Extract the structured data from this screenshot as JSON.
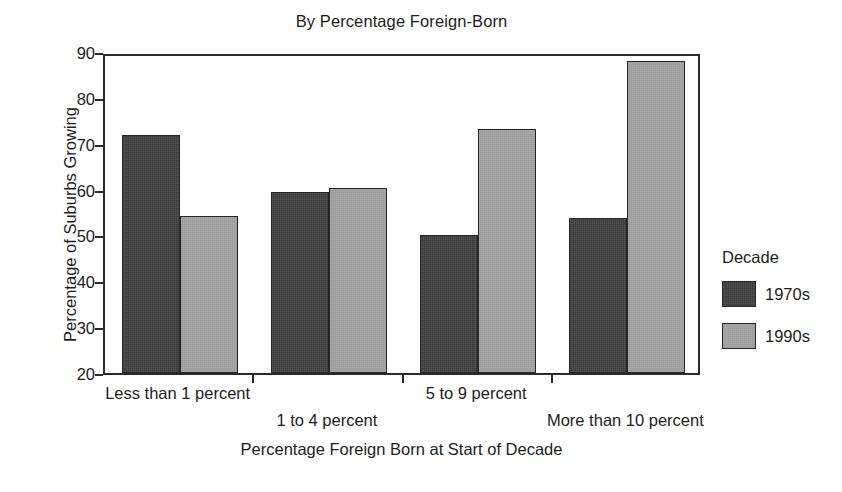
{
  "chart_data": {
    "type": "bar",
    "title": "By Percentage Foreign-Born",
    "xlabel": "Percentage Foreign Born at Start of Decade",
    "ylabel": "Percentage of Suburbs Growing",
    "categories": [
      "Less than 1 percent",
      "1 to 4 percent",
      "5 to 9 percent",
      "More than 10 percent"
    ],
    "series": [
      {
        "name": "1970s",
        "color": "#3b3b3b",
        "values": [
          72.0,
          59.4,
          50.2,
          53.7
        ]
      },
      {
        "name": "1990s",
        "color": "#9d9d9d",
        "values": [
          54.3,
          60.3,
          73.3,
          88.0
        ]
      }
    ],
    "ylim": [
      20,
      90
    ],
    "yticks": [
      20,
      30,
      40,
      50,
      60,
      70,
      80,
      90
    ],
    "ytick_labels": [
      "20",
      "30",
      "40",
      "50",
      "60",
      "70",
      "80",
      "90"
    ],
    "grid": false,
    "legend": {
      "position": "right",
      "title": "Decade",
      "entries": [
        "1970s",
        "1990s"
      ]
    },
    "category_label_rows": [
      0,
      1,
      0,
      1
    ]
  },
  "axes": {
    "y_title": "Percentage of Suburbs Growing",
    "x_title": "Percentage Foreign Born at Start of Decade"
  },
  "legend": {
    "title": "Decade",
    "items": [
      {
        "label": "1970s"
      },
      {
        "label": "1990s"
      }
    ]
  }
}
